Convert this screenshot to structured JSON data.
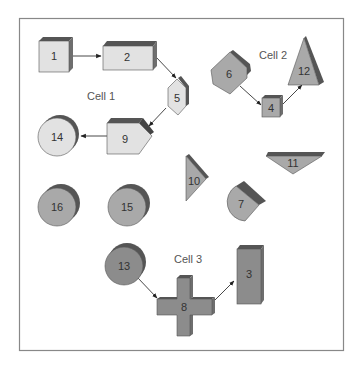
{
  "diagram": {
    "colors": {
      "light_fill": "#e2e2e2",
      "mid_fill": "#a9a9a9",
      "dark_fill": "#8c8c8c",
      "shadow": "#555555",
      "side": "#6e6e6e",
      "stroke": "#444444",
      "frame": "#888888"
    },
    "cells": [
      {
        "label": "Cell 1"
      },
      {
        "label": "Cell 2"
      },
      {
        "label": "Cell 3"
      }
    ],
    "shapes": [
      {
        "id": "1",
        "label": "1",
        "type": "cube",
        "cell": "Cell 1"
      },
      {
        "id": "2",
        "label": "2",
        "type": "box",
        "cell": "Cell 1"
      },
      {
        "id": "5",
        "label": "5",
        "type": "hexagon",
        "cell": "Cell 1"
      },
      {
        "id": "9",
        "label": "9",
        "type": "pentagon-arrow",
        "cell": "Cell 1"
      },
      {
        "id": "14",
        "label": "14",
        "type": "cylinder",
        "cell": "Cell 1"
      },
      {
        "id": "6",
        "label": "6",
        "type": "hexagon",
        "cell": "Cell 2"
      },
      {
        "id": "4",
        "label": "4",
        "type": "cube",
        "cell": "Cell 2"
      },
      {
        "id": "12",
        "label": "12",
        "type": "triangle",
        "cell": "Cell 2"
      },
      {
        "id": "10",
        "label": "10",
        "type": "triangle",
        "cell": null
      },
      {
        "id": "11",
        "label": "11",
        "type": "inverted-triangle",
        "cell": null
      },
      {
        "id": "7",
        "label": "7",
        "type": "d-shape",
        "cell": null
      },
      {
        "id": "16",
        "label": "16",
        "type": "cylinder",
        "cell": null
      },
      {
        "id": "15",
        "label": "15",
        "type": "cylinder",
        "cell": null
      },
      {
        "id": "13",
        "label": "13",
        "type": "cylinder",
        "cell": "Cell 3"
      },
      {
        "id": "8",
        "label": "8",
        "type": "cross",
        "cell": "Cell 3"
      },
      {
        "id": "3",
        "label": "3",
        "type": "tall-box",
        "cell": "Cell 3"
      }
    ],
    "connections": [
      {
        "from": "1",
        "to": "2"
      },
      {
        "from": "2",
        "to": "5"
      },
      {
        "from": "5",
        "to": "9"
      },
      {
        "from": "9",
        "to": "14"
      },
      {
        "from": "6",
        "to": "4"
      },
      {
        "from": "4",
        "to": "12"
      },
      {
        "from": "13",
        "to": "8"
      },
      {
        "from": "8",
        "to": "3"
      }
    ]
  }
}
